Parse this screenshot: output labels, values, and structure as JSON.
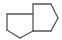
{
  "diagram": {
    "type": "chemical-structure",
    "name": "bicyclo[3.3.0]octane",
    "stroke_color": "#555555",
    "background": "#ffffff",
    "atoms": [
      {
        "id": "A",
        "x": 7,
        "y": 14
      },
      {
        "id": "B",
        "x": 33,
        "y": 14
      },
      {
        "id": "C",
        "x": 7,
        "y": 30
      },
      {
        "id": "D",
        "x": 20,
        "y": 38
      },
      {
        "id": "E",
        "x": 33,
        "y": 31
      },
      {
        "id": "F",
        "x": 33,
        "y": 4
      },
      {
        "id": "G",
        "x": 51,
        "y": 4
      },
      {
        "id": "H",
        "x": 58,
        "y": 18
      },
      {
        "id": "I",
        "x": 51,
        "y": 31
      }
    ],
    "bonds": [
      [
        "A",
        "B"
      ],
      [
        "A",
        "C"
      ],
      [
        "C",
        "D"
      ],
      [
        "D",
        "E"
      ],
      [
        "F",
        "E"
      ],
      [
        "F",
        "G"
      ],
      [
        "G",
        "H"
      ],
      [
        "H",
        "I"
      ],
      [
        "I",
        "E"
      ]
    ]
  }
}
